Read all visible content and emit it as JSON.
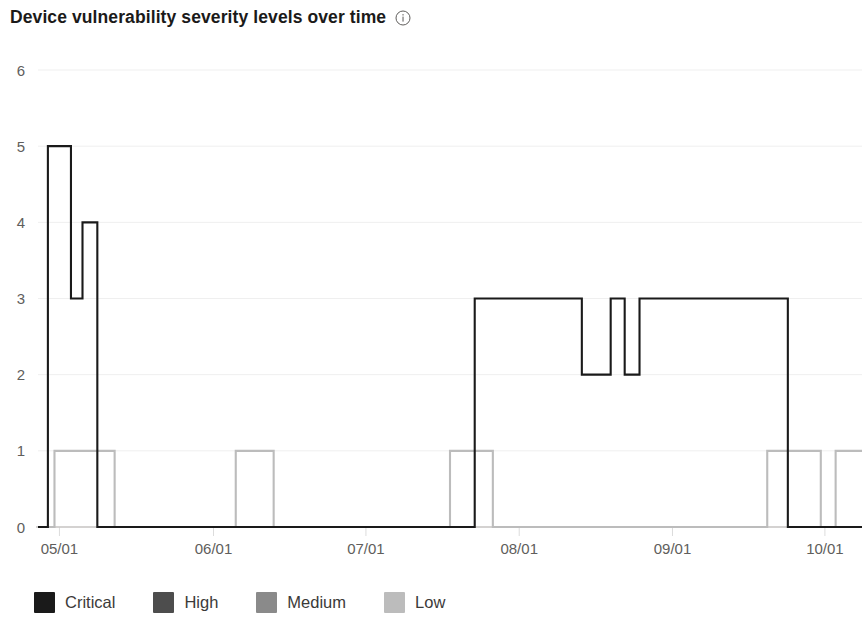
{
  "header": {
    "title": "Device vulnerability severity levels over time",
    "info_icon": "info-circle-icon",
    "info_tooltip": "i"
  },
  "legend": {
    "position": "bottom-left",
    "items": [
      {
        "label": "Critical",
        "color": "#1a1a1a",
        "swatch": "legend-swatch-critical"
      },
      {
        "label": "High",
        "color": "#4d4d4d",
        "swatch": "legend-swatch-high"
      },
      {
        "label": "Medium",
        "color": "#8a8a8a",
        "swatch": "legend-swatch-medium"
      },
      {
        "label": "Low",
        "color": "#bcbcbc",
        "swatch": "legend-swatch-low"
      }
    ]
  },
  "chart_data": {
    "type": "line",
    "title": "Device vulnerability severity levels over time",
    "xlabel": "",
    "ylabel": "",
    "grid": true,
    "line_style": "step",
    "xlim": [
      0,
      100
    ],
    "ylim": [
      0,
      6
    ],
    "y_ticks": [
      0,
      1,
      2,
      3,
      4,
      5,
      6
    ],
    "x_tick_labels": [
      "05/01",
      "06/01",
      "07/01",
      "08/01",
      "09/01",
      "10/01"
    ],
    "x_tick_positions": [
      2.6,
      21.3,
      39.8,
      58.4,
      77.0,
      95.5
    ],
    "legend_position": "bottom",
    "series": [
      {
        "name": "Critical",
        "color": "#1a1a1a",
        "x": [
          0.0,
          1.2,
          1.2,
          4.0,
          4.0,
          5.4,
          5.4,
          7.2,
          7.2,
          9.3,
          9.3,
          53.0,
          53.0,
          56.0,
          56.0,
          66.0,
          66.0,
          69.5,
          69.5,
          71.2,
          71.2,
          73.0,
          73.0,
          75.5,
          75.5,
          91.0,
          91.0,
          92.4,
          92.4,
          100.0
        ],
        "y": [
          0,
          0,
          5,
          5,
          3,
          3,
          4,
          4,
          0,
          0,
          0,
          0,
          3,
          3,
          3,
          3,
          2,
          2,
          3,
          3,
          2,
          2,
          3,
          3,
          3,
          3,
          0,
          0,
          0,
          0
        ],
        "description": "Critical severity step series: spike to 5 then 3 then 4 in early May, flat at 0 until late July, plateau at 3 from early August through late September with two dips to 2 in mid-August, then back to 0 in October."
      },
      {
        "name": "Low",
        "color": "#bcbcbc",
        "x": [
          0.0,
          2.0,
          2.0,
          4.2,
          4.2,
          9.3,
          9.3,
          24.0,
          24.0,
          28.6,
          28.6,
          50.0,
          50.0,
          53.0,
          53.0,
          55.2,
          55.2,
          88.5,
          88.5,
          95.0,
          95.0,
          96.8,
          96.8,
          100.0
        ],
        "y": [
          0,
          0,
          1,
          1,
          1,
          1,
          0,
          0,
          1,
          1,
          0,
          0,
          1,
          1,
          1,
          1,
          0,
          0,
          1,
          1,
          0,
          0,
          1,
          1
        ],
        "description": "Low severity step series hovering between 0 and 1: brief rise to 1 in early May, again in early June, in late July, and twice in October."
      },
      {
        "name": "High",
        "color": "#4d4d4d",
        "x": [],
        "y": [],
        "description": "No visible data points plotted for High severity."
      },
      {
        "name": "Medium",
        "color": "#8a8a8a",
        "x": [],
        "y": [],
        "description": "No visible data points plotted for Medium severity."
      }
    ],
    "annotations": []
  }
}
